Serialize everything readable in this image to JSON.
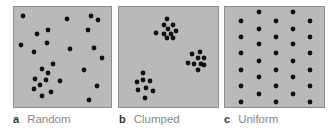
{
  "figure": {
    "panels": [
      {
        "letter": "a",
        "label": "Random",
        "x": 13,
        "width": 99,
        "dots": [
          [
            22,
            15
          ],
          [
            66,
            18
          ],
          [
            90,
            15
          ],
          [
            97,
            19
          ],
          [
            47,
            29
          ],
          [
            36,
            33
          ],
          [
            87,
            29
          ],
          [
            20,
            44
          ],
          [
            46,
            42
          ],
          [
            33,
            51
          ],
          [
            69,
            48
          ],
          [
            93,
            47
          ],
          [
            101,
            57
          ],
          [
            52,
            63
          ],
          [
            41,
            68
          ],
          [
            47,
            72
          ],
          [
            83,
            69
          ],
          [
            34,
            78
          ],
          [
            45,
            79
          ],
          [
            59,
            80
          ],
          [
            39,
            84
          ],
          [
            33,
            88
          ],
          [
            96,
            85
          ],
          [
            50,
            91
          ],
          [
            41,
            95
          ],
          [
            88,
            99
          ]
        ]
      },
      {
        "letter": "b",
        "label": "Clumped",
        "x": 118,
        "width": 101,
        "dots": [
          [
            166,
            18
          ],
          [
            163,
            24
          ],
          [
            172,
            24
          ],
          [
            155,
            32
          ],
          [
            167,
            28
          ],
          [
            175,
            30
          ],
          [
            163,
            33
          ],
          [
            170,
            33
          ],
          [
            166,
            37
          ],
          [
            172,
            37
          ],
          [
            199,
            51
          ],
          [
            191,
            53
          ],
          [
            197,
            57
          ],
          [
            203,
            57
          ],
          [
            187,
            62
          ],
          [
            193,
            63
          ],
          [
            200,
            63
          ],
          [
            203,
            64
          ],
          [
            197,
            69
          ],
          [
            142,
            72
          ],
          [
            136,
            81
          ],
          [
            142,
            79
          ],
          [
            149,
            80
          ],
          [
            145,
            87
          ],
          [
            137,
            89
          ],
          [
            152,
            90
          ],
          [
            144,
            97
          ]
        ]
      },
      {
        "letter": "c",
        "label": "Uniform",
        "x": 224,
        "width": 101,
        "dots": [
          [
            258,
            11
          ],
          [
            292,
            11
          ],
          [
            240,
            20
          ],
          [
            275,
            20
          ],
          [
            309,
            20
          ],
          [
            258,
            28
          ],
          [
            292,
            28
          ],
          [
            240,
            36
          ],
          [
            275,
            36
          ],
          [
            309,
            36
          ],
          [
            258,
            43
          ],
          [
            292,
            43
          ],
          [
            240,
            52
          ],
          [
            275,
            52
          ],
          [
            309,
            52
          ],
          [
            258,
            60
          ],
          [
            292,
            60
          ],
          [
            240,
            69
          ],
          [
            275,
            69
          ],
          [
            309,
            69
          ],
          [
            258,
            76
          ],
          [
            292,
            76
          ],
          [
            240,
            85
          ],
          [
            275,
            85
          ],
          [
            309,
            85
          ],
          [
            258,
            93
          ],
          [
            292,
            93
          ],
          [
            240,
            101
          ],
          [
            275,
            101
          ],
          [
            309,
            101
          ]
        ]
      }
    ],
    "dot_color": "#111111",
    "panel_color": "#b9b9b9"
  }
}
